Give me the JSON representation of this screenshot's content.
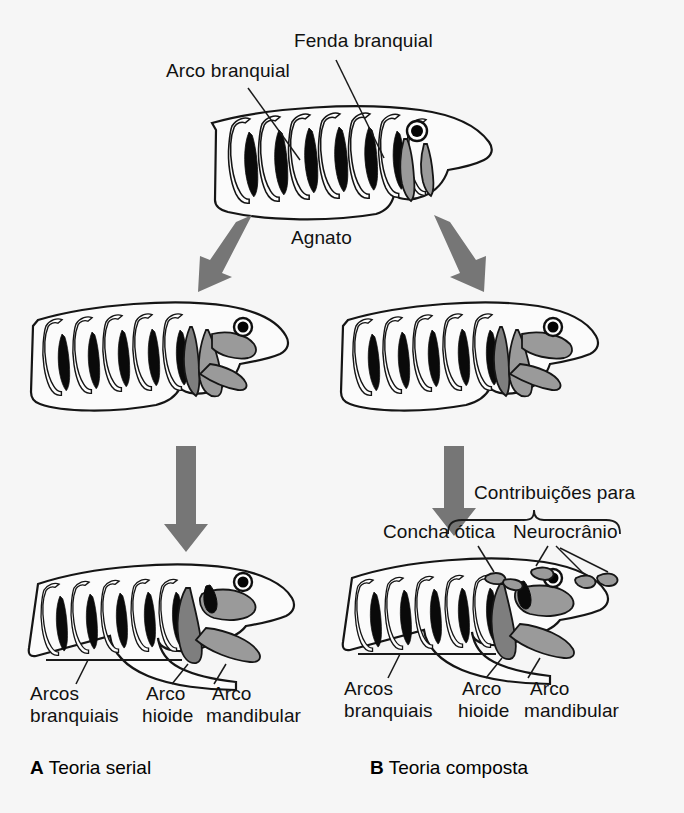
{
  "figure": {
    "title_top_labels": {
      "gill_arch": "Arco branquial",
      "gill_slit": "Fenda branquial"
    },
    "ancestor": {
      "label": "Agnato",
      "arch_count": 8
    },
    "panels": [
      {
        "id": "A",
        "letter": "A",
        "caption": "Teoria serial",
        "labels": {
          "branchial": "Arcos\nbranquiais",
          "branchial_line1": "Arcos",
          "branchial_line2": "branquiais",
          "hyoid_line1": "Arco",
          "hyoid_line2": "hioide",
          "mandibular_line1": "Arco",
          "mandibular_line2": "mandibular"
        }
      },
      {
        "id": "B",
        "letter": "B",
        "caption": "Teoria composta",
        "labels": {
          "branchial_line1": "Arcos",
          "branchial_line2": "branquiais",
          "hyoid_line1": "Arco",
          "hyoid_line2": "hioide",
          "mandibular_line1": "Arco",
          "mandibular_line2": "mandibular",
          "contributions": "Contribuições para",
          "otic_capsule": "Concha ótica",
          "neurocranium": "Neurocrânio"
        }
      }
    ],
    "colors": {
      "background": "#f6f6f6",
      "ink": "#151515",
      "arrow_gray": "#767676",
      "arch_gray": "#9a9a9a",
      "arch_gray_dark": "#7e7e7e",
      "arch_black": "#0a0a0a"
    }
  }
}
